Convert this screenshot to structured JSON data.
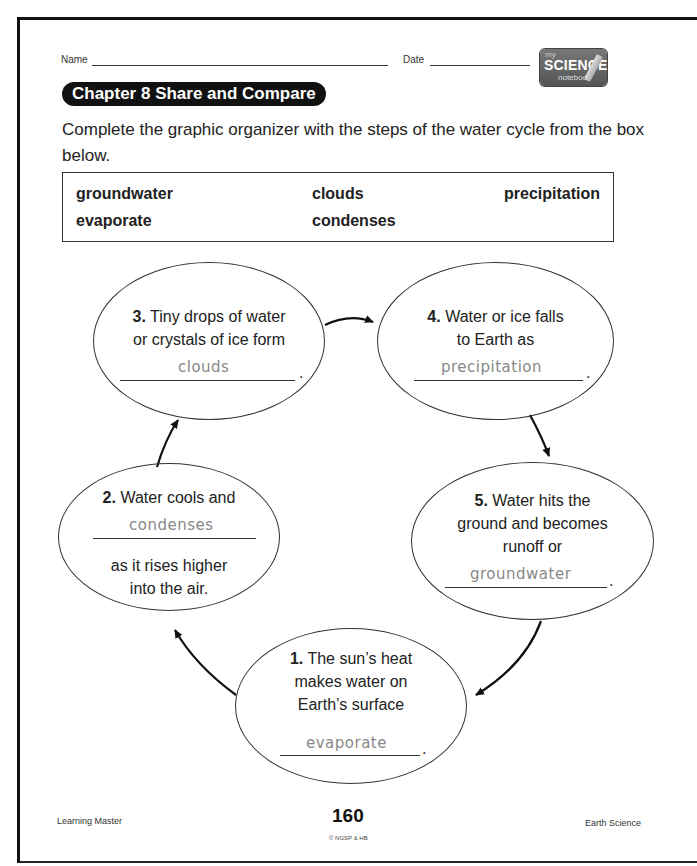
{
  "header": {
    "name_label": "Name",
    "date_label": "Date",
    "badge": {
      "my": "my",
      "science": "SCIENCE",
      "notebook": "notebook",
      "icon": "pencil-icon"
    }
  },
  "chapter_title": "Chapter 8  Share and Compare",
  "instructions": "Complete the graphic organizer with the steps of the water cycle from the box below.",
  "word_box": {
    "words": [
      "groundwater",
      "clouds",
      "precipitation",
      "evaporate",
      "condenses"
    ]
  },
  "organizer": {
    "steps": [
      {
        "number": "1.",
        "lines": [
          "The sun’s heat",
          "makes water on",
          "Earth’s surface"
        ],
        "answer": "evaporate",
        "end": "."
      },
      {
        "number": "2.",
        "lines": [
          "Water cools and"
        ],
        "answer": "condenses",
        "after": [
          "as it rises higher",
          "into the air."
        ]
      },
      {
        "number": "3.",
        "lines": [
          "Tiny drops of water",
          "or crystals of ice form"
        ],
        "answer": "clouds",
        "end": "."
      },
      {
        "number": "4.",
        "lines": [
          "Water or ice falls",
          "to Earth as"
        ],
        "answer": "precipitation",
        "end": "."
      },
      {
        "number": "5.",
        "lines": [
          "Water hits the",
          "ground and becomes",
          "runoff or"
        ],
        "answer": "groundwater",
        "end": "."
      }
    ]
  },
  "footer": {
    "left": "Learning Master",
    "page_number": "160",
    "copyright": "© NGSP & HB",
    "right": "Earth Science"
  }
}
